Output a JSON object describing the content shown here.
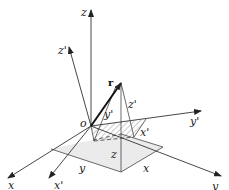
{
  "diagram": {
    "title": "",
    "labels": {
      "z": "z",
      "z_prime": "z'",
      "r": "r",
      "o": "o",
      "y_prime_top": "y'",
      "z_prime_seg": "z'",
      "x_prime_seg": "x'",
      "y_prime_axis": "y'",
      "z_seg": "z",
      "x_axis": "x",
      "x_prime_axis": "x'",
      "y_seg": "y",
      "x_seg": "x",
      "y_axis": "y"
    },
    "colors": {
      "line": "#333333",
      "dotted_fill": "#e6e6e6",
      "hatch": "#9a9a9a"
    }
  }
}
